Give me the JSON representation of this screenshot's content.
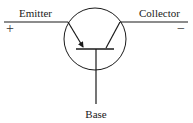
{
  "diagram": {
    "type": "transistor-symbol",
    "labels": {
      "emitter": "Emitter",
      "collector": "Collector",
      "base": "Base"
    },
    "polarity": {
      "emitter_sign": "+",
      "collector_sign": "−"
    },
    "colors": {
      "stroke": "#1a1a1a",
      "background": "#ffffff"
    }
  }
}
